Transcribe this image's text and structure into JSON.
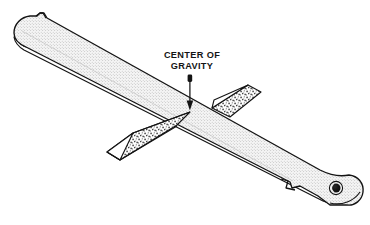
{
  "figure": {
    "background_color": "#ffffff",
    "line_color": "#141414"
  },
  "callout": {
    "line1": "CENTER OF",
    "line2": "GRAVITY",
    "text_color": "#141414",
    "leader": {
      "style": "vertical-line-with-arrowhead",
      "arrow_direction": "down",
      "points_to": "ruler-top-face-balance-point"
    }
  },
  "ruler": {
    "name": "ruler",
    "face_color": "#f2f2f2",
    "edge_color": "#ffffff",
    "outline_color": "#141414",
    "texture": "fine-halftone-stipple",
    "left_end": {
      "shape": "rounded-tip",
      "feature": "top-edge-notch"
    },
    "right_end": {
      "shape": "rounded-paddle",
      "feature": "hanging-hole",
      "notch": "v-notch-lower-edge"
    }
  },
  "fulcrum": {
    "name": "triangular-wedge-fulcrum",
    "front_block": {
      "label": "front-wedge",
      "face_color": "#ffffff",
      "slant_texture": "coarse-stipple",
      "outline_color": "#141414"
    },
    "back_block": {
      "label": "back-wedge",
      "face_color": "#ffffff",
      "slant_texture": "coarse-stipple",
      "outline_color": "#141414"
    }
  },
  "hole": {
    "name": "hanging-hole",
    "fill_color": "#1a1a1a",
    "highlight_color": "#f2f2f2"
  }
}
